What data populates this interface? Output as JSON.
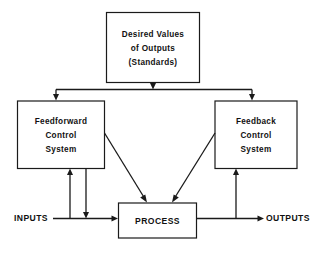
{
  "diagram": {
    "nodes": {
      "standards": {
        "name": "desired-values-box",
        "lines": [
          "Desired Values",
          "of Outputs",
          "(Standards)"
        ]
      },
      "feedforward": {
        "name": "feedforward-control-system-box",
        "lines": [
          "Feedforward",
          "Control",
          "System"
        ]
      },
      "feedback": {
        "name": "feedback-control-system-box",
        "lines": [
          "Feedback",
          "Control",
          "System"
        ]
      },
      "process": {
        "name": "process-box",
        "lines": [
          "PROCESS"
        ]
      }
    },
    "labels": {
      "inputs": "INPUTS",
      "outputs": "OUTPUTS"
    },
    "colors": {
      "stroke": "#1a1a1a",
      "fill": "#ffffff",
      "text": "#111111",
      "background": "#ffffff"
    }
  }
}
